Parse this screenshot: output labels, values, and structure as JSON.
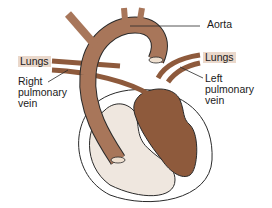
{
  "diagram": {
    "labels": {
      "aorta": "Aorta",
      "lungs_left_side": "Lungs",
      "lungs_right_side": "Lungs",
      "right_pulmonary_vein": [
        "Right",
        "pulmonary",
        "vein"
      ],
      "left_pulmonary_vein": [
        "Left",
        "pulmonary",
        "vein"
      ]
    },
    "colors": {
      "aorta": "#a8765a",
      "left_heart": "#8e5a3c",
      "right_heart": "#efe7df",
      "lungs_tag": "#ead8cb",
      "outline": "#2a2a2a"
    }
  }
}
